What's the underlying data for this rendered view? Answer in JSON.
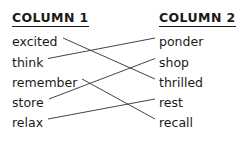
{
  "headers": {
    "left": "COLUMN 1",
    "right": "COLUMN 2"
  },
  "column1": [
    {
      "label": "excited"
    },
    {
      "label": "think"
    },
    {
      "label": "remember"
    },
    {
      "label": "store"
    },
    {
      "label": "relax"
    }
  ],
  "column2": [
    {
      "label": "ponder"
    },
    {
      "label": "shop"
    },
    {
      "label": "thrilled"
    },
    {
      "label": "rest"
    },
    {
      "label": "recall"
    }
  ],
  "connections": [
    {
      "from": "excited",
      "to": "thrilled"
    },
    {
      "from": "think",
      "to": "ponder"
    },
    {
      "from": "remember",
      "to": "recall"
    },
    {
      "from": "store",
      "to": "shop"
    },
    {
      "from": "relax",
      "to": "rest"
    }
  ],
  "style": {
    "line_color": "#444444",
    "text_color": "#1a1a1a",
    "background": "#ffffff"
  }
}
